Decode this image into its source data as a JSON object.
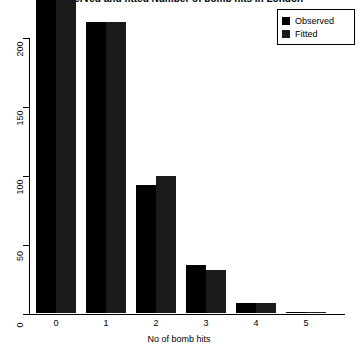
{
  "chart_data": {
    "type": "bar",
    "title": "Observed and fitted Number of bomb hits in London",
    "xlabel": "No of bomb hits",
    "ylabel": "",
    "categories": [
      "0",
      "1",
      "2",
      "3",
      "4",
      "5"
    ],
    "series": [
      {
        "name": "Observed",
        "color": "#000000",
        "values": [
          229,
          211,
          93,
          35,
          7,
          1
        ]
      },
      {
        "name": "Fitted",
        "color": "#1a1a1a",
        "values": [
          227,
          211,
          99,
          31,
          7,
          1
        ]
      }
    ],
    "ylim": [
      0,
      200
    ],
    "yticks": [
      0,
      50,
      100,
      150,
      200
    ],
    "ytick_labels": [
      "0",
      "50",
      "100",
      "150",
      "200"
    ],
    "grid": false,
    "legend_position": "top-right"
  },
  "legend": {
    "entries": [
      {
        "label": "Observed",
        "color": "#000000"
      },
      {
        "label": "Fitted",
        "color": "#1a1a1a"
      }
    ]
  }
}
